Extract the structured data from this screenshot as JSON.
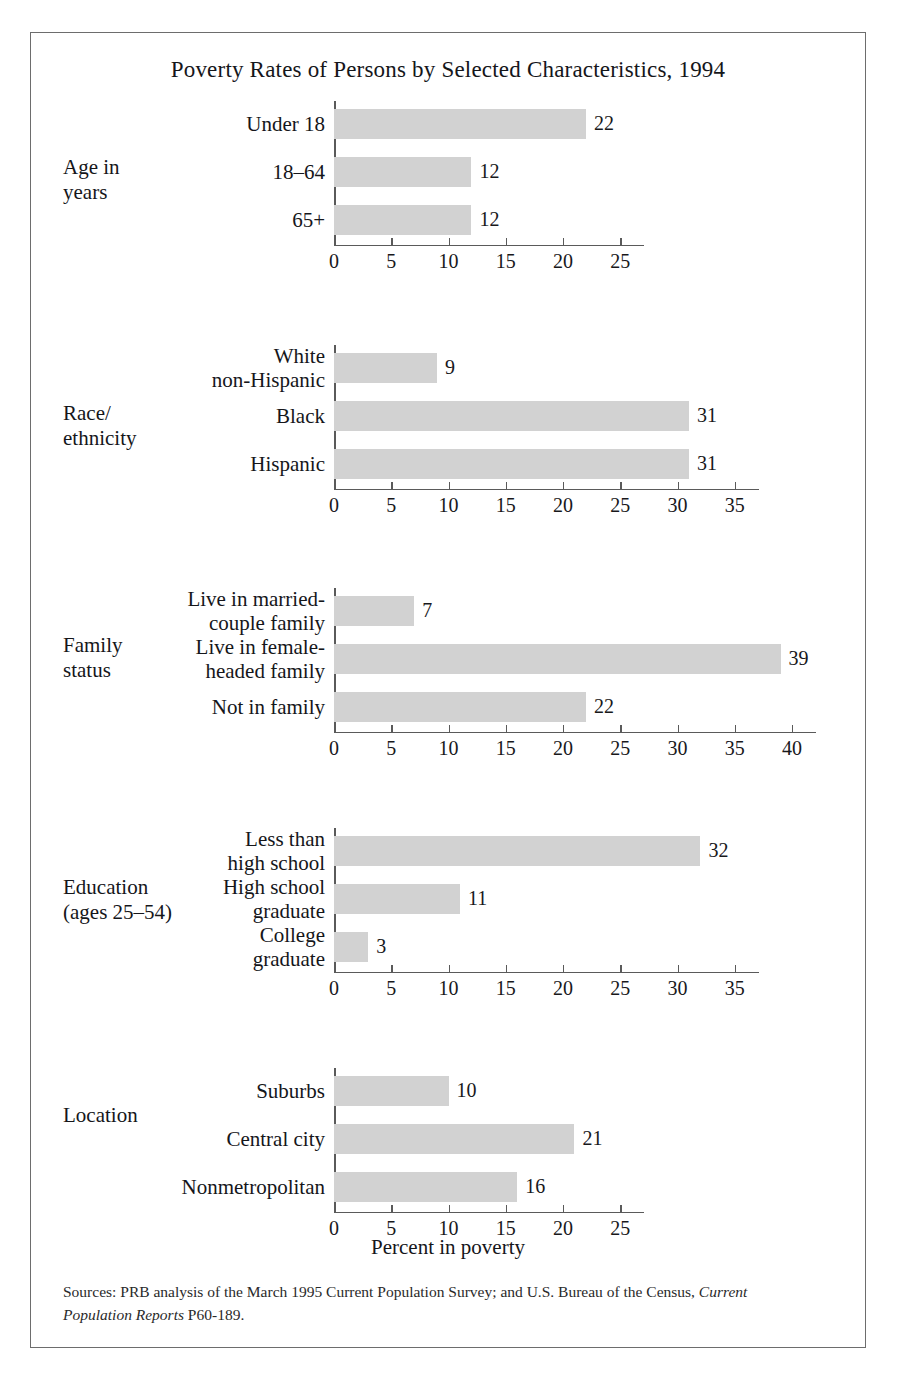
{
  "figure": {
    "title": "Poverty Rates of Persons by Selected Characteristics, 1994",
    "axis_caption": "Percent in poverty",
    "source_prefix": "Sources: PRB analysis of the March 1995 Current Population Survey; and U.S. Bureau of the Census, ",
    "source_italic": "Current Population Reports",
    "source_suffix": " P60-189.",
    "frame_color": "#6d6d6d",
    "bar_color": "#d2d2d2",
    "axis_color": "#5a5a5a"
  },
  "chart_data": {
    "type": "bar",
    "orientation": "horizontal",
    "title": "Poverty Rates of Persons by Selected Characteristics, 1994",
    "xlabel": "Percent in poverty",
    "ylabel": "",
    "grid": false,
    "legend": "none",
    "units": "percent",
    "panels": [
      {
        "group": "Age in\nyears",
        "group_line1": "Age in",
        "group_line2": "years",
        "categories": [
          "Under 18",
          "18–64",
          "65+"
        ],
        "values": [
          22,
          12,
          12
        ],
        "value_labels": [
          "22",
          "12",
          "12"
        ],
        "xlim": [
          0,
          25
        ],
        "xticks": [
          0,
          5,
          10,
          15,
          20,
          25
        ],
        "xtick_labels": [
          "0",
          "5",
          "10",
          "15",
          "20",
          "25"
        ]
      },
      {
        "group": "Race/\nethnicity",
        "group_line1": "Race/",
        "group_line2": "ethnicity",
        "categories": [
          "White\nnon-Hispanic",
          "Black",
          "Hispanic"
        ],
        "values": [
          9,
          31,
          31
        ],
        "value_labels": [
          "9",
          "31",
          "31"
        ],
        "xlim": [
          0,
          35
        ],
        "xticks": [
          0,
          5,
          10,
          15,
          20,
          25,
          30,
          35
        ],
        "xtick_labels": [
          "0",
          "5",
          "10",
          "15",
          "20",
          "25",
          "30",
          "35"
        ]
      },
      {
        "group": "Family\nstatus",
        "group_line1": "Family",
        "group_line2": "status",
        "categories": [
          "Live in married-\ncouple family",
          "Live in female-\nheaded family",
          "Not in family"
        ],
        "values": [
          7,
          39,
          22
        ],
        "value_labels": [
          "7",
          "39",
          "22"
        ],
        "xlim": [
          0,
          40
        ],
        "xticks": [
          0,
          5,
          10,
          15,
          20,
          25,
          30,
          35,
          40
        ],
        "xtick_labels": [
          "0",
          "5",
          "10",
          "15",
          "20",
          "25",
          "30",
          "35",
          "40"
        ]
      },
      {
        "group": "Education\n(ages 25–54)",
        "group_line1": "Education",
        "group_line2": "(ages 25–54)",
        "categories": [
          "Less than\nhigh school",
          "High school\ngraduate",
          "College\ngraduate"
        ],
        "values": [
          32,
          11,
          3
        ],
        "value_labels": [
          "32",
          "11",
          "3"
        ],
        "xlim": [
          0,
          35
        ],
        "xticks": [
          0,
          5,
          10,
          15,
          20,
          25,
          30,
          35
        ],
        "xtick_labels": [
          "0",
          "5",
          "10",
          "15",
          "20",
          "25",
          "30",
          "35"
        ]
      },
      {
        "group": "Location",
        "group_line1": "Location",
        "group_line2": "",
        "categories": [
          "Suburbs",
          "Central city",
          "Nonmetropolitan"
        ],
        "values": [
          10,
          21,
          16
        ],
        "value_labels": [
          "10",
          "21",
          "16"
        ],
        "xlim": [
          0,
          25
        ],
        "xticks": [
          0,
          5,
          10,
          15,
          20,
          25
        ],
        "xtick_labels": [
          "0",
          "5",
          "10",
          "15",
          "20",
          "25"
        ]
      }
    ]
  }
}
